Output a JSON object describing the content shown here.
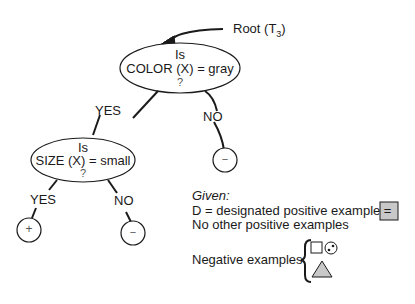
{
  "root_label": {
    "text": "Root (T",
    "subscript": "3",
    "close": ")"
  },
  "root_node": {
    "line1": "Is",
    "line2": "COLOR (X) = gray",
    "line3": "?"
  },
  "root_yes": "YES",
  "root_no": "NO",
  "root_no_leaf": "−",
  "size_node": {
    "line1": "Is",
    "line2": "SIZE (X) = small",
    "line3": "?"
  },
  "size_yes": "YES",
  "size_no": "NO",
  "size_yes_leaf": "+",
  "size_no_leaf": "−",
  "given": {
    "heading": "Given:",
    "line1": "D = designated positive example =",
    "line2": "No other positive examples",
    "negative_label": "Negative examples"
  },
  "colors": {
    "gray_fill": "#c8c8c8",
    "ink": "#1a1a1a"
  }
}
